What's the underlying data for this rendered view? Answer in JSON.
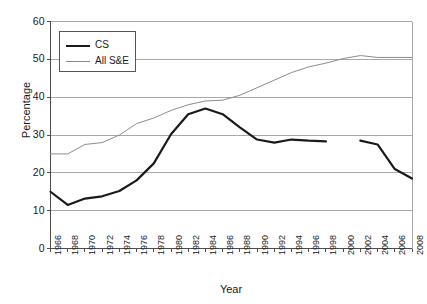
{
  "chart_data": {
    "type": "line",
    "title": "",
    "xlabel": "Year",
    "ylabel": "Percentage",
    "xlim": [
      1966,
      2008
    ],
    "ylim": [
      0,
      60
    ],
    "grid": true,
    "grid_axis": "y",
    "legend_position": "upper-left-inside",
    "x": [
      1966,
      1968,
      1970,
      1972,
      1974,
      1976,
      1978,
      1980,
      1982,
      1984,
      1986,
      1988,
      1990,
      1992,
      1994,
      1996,
      1998,
      2000,
      2002,
      2004,
      2006,
      2008
    ],
    "xtick_labels": [
      "1966",
      "1968",
      "1970",
      "1972",
      "1974",
      "1976",
      "1978",
      "1980",
      "1982",
      "1984",
      "1986",
      "1988",
      "1990",
      "1992",
      "1994",
      "1996",
      "1998",
      "2000",
      "2002",
      "2004",
      "2006",
      "2008"
    ],
    "ytick_labels": [
      "0",
      "10",
      "20",
      "30",
      "40",
      "50",
      "60"
    ],
    "ytick_values": [
      0,
      10,
      20,
      30,
      40,
      50,
      60
    ],
    "series": [
      {
        "name": "CS",
        "color": "#1a1a1a",
        "width": 2.2,
        "values": [
          15.0,
          11.5,
          13.2,
          13.8,
          15.2,
          18.0,
          22.5,
          30.2,
          35.5,
          37.0,
          35.5,
          32.0,
          28.8,
          28.0,
          28.8,
          28.5,
          28.3,
          null,
          28.5,
          27.5,
          21.0,
          18.5
        ]
      },
      {
        "name": "All S&E",
        "color": "#8c8c8c",
        "width": 1.0,
        "values": [
          25.0,
          25.0,
          27.5,
          28.0,
          30.0,
          33.0,
          34.5,
          36.5,
          38.0,
          39.0,
          39.2,
          40.5,
          42.5,
          44.5,
          46.5,
          48.0,
          49.0,
          50.2,
          51.0,
          50.5,
          50.5,
          50.5
        ]
      }
    ]
  },
  "legend": {
    "entries": [
      {
        "label": "CS",
        "swatch": "thick-black-line"
      },
      {
        "label": "All S&E",
        "swatch": "thin-gray-line"
      }
    ]
  },
  "colors": {
    "cs_line": "#1a1a1a",
    "se_line": "#8c8c8c",
    "gridline": "#a8a8a8",
    "axis": "#4d4d4d",
    "text": "#1a1a1a",
    "background": "#ffffff"
  }
}
